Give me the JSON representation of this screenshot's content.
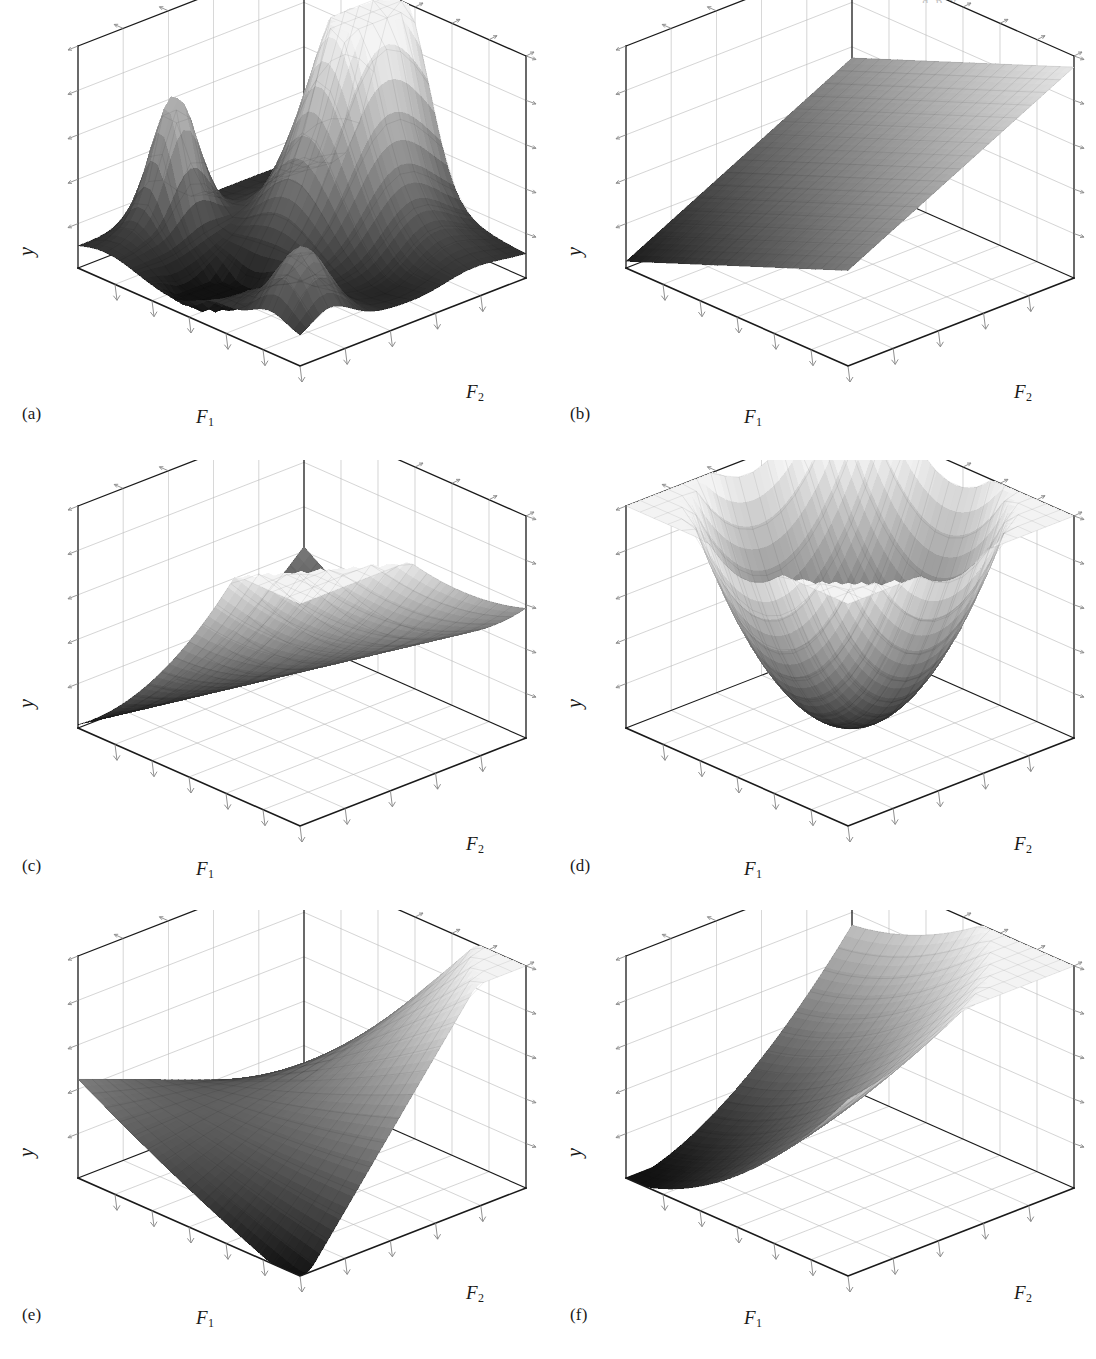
{
  "figure": {
    "page_header_fragment": "g p y",
    "layout": {
      "columns": 2,
      "rows": 3,
      "width": 1096,
      "height": 1359
    },
    "colors": {
      "background": "#ffffff",
      "axis_line": "#1a1a1a",
      "grid_line": "#b9b9b9",
      "tick_line": "#8a8a8a",
      "surface_light": "#f2f2f2",
      "surface_mid": "#7a7a7a",
      "surface_dark": "#0d0d0d",
      "mesh_line": "#5a5a5a"
    },
    "shared_axes": {
      "x_label": "F",
      "x_sub": "1",
      "z_label": "F",
      "z_sub": "2",
      "y_label": "y",
      "x_ticks": 6,
      "z_ticks": 5,
      "y_ticks": 5,
      "gridlines": true,
      "tick_labels_shown": false
    },
    "panels": [
      {
        "id": "a",
        "label": "(a)",
        "surface": "multimodal-peaks",
        "description": "Highly multimodal response surface with a tall central ridge, several secondary peaks and deep valleys"
      },
      {
        "id": "b",
        "label": "(b)",
        "surface": "planar",
        "description": "Flat inclined plane, first-order main-effects model rising with both factors"
      },
      {
        "id": "c",
        "label": "(c)",
        "surface": "rising-ridge",
        "description": "Parabolic valley / rising ridge, minimum along a curved trough"
      },
      {
        "id": "d",
        "label": "(d)",
        "surface": "bowl",
        "description": "Elliptic paraboloid bowl with a single interior minimum"
      },
      {
        "id": "e",
        "label": "(e)",
        "surface": "saddle",
        "description": "Saddle (hyperbolic paraboloid) twisted surface from a two-factor interaction"
      },
      {
        "id": "f",
        "label": "(f)",
        "surface": "folded-ridge",
        "description": "Folded stationary ridge rising steeply toward the far corner"
      }
    ]
  },
  "chart_data": [
    {
      "type": "surface",
      "panel": "a",
      "title": "(a)",
      "xlabel": "F1",
      "ylabel": "y",
      "zlabel": "F2",
      "function": "multimodal",
      "xlim": [
        0,
        1
      ],
      "zlim": [
        0,
        1
      ],
      "ylim": [
        0,
        1
      ],
      "grid": true,
      "x_ticks": 6,
      "z_ticks": 5,
      "y_ticks": 5,
      "peaks": [
        {
          "x": 0.42,
          "z": 0.82,
          "height": 1.0
        },
        {
          "x": 0.12,
          "z": 0.3,
          "height": 0.55
        },
        {
          "x": 0.78,
          "z": 0.18,
          "height": 0.33
        }
      ],
      "valleys": [
        {
          "x": 0.45,
          "z": 0.25,
          "depth": 0.02
        },
        {
          "x": 0.7,
          "z": 0.55,
          "depth": 0.08
        }
      ]
    },
    {
      "type": "surface",
      "panel": "b",
      "title": "(b)",
      "xlabel": "F1",
      "ylabel": "y",
      "zlabel": "F2",
      "function": "plane",
      "xlim": [
        0,
        1
      ],
      "zlim": [
        0,
        1
      ],
      "ylim": [
        0,
        1
      ],
      "grid": true,
      "x_ticks": 6,
      "z_ticks": 5,
      "y_ticks": 5,
      "corner_values": {
        "x0z0": 0.02,
        "x1z0": 0.4,
        "x0z1": 0.52,
        "x1z1": 0.9
      }
    },
    {
      "type": "surface",
      "panel": "c",
      "title": "(c)",
      "xlabel": "F1",
      "ylabel": "y",
      "zlabel": "F2",
      "function": "rising-ridge",
      "xlim": [
        0,
        1
      ],
      "zlim": [
        0,
        1
      ],
      "ylim": [
        0,
        1
      ],
      "grid": true,
      "x_ticks": 6,
      "z_ticks": 5,
      "y_ticks": 5,
      "trough_axis": "diagonal",
      "corner_values": {
        "x0z0": 0.95,
        "x1z0": 0.12,
        "x0z1": 0.4,
        "x1z1": 0.78
      }
    },
    {
      "type": "surface",
      "panel": "d",
      "title": "(d)",
      "xlabel": "F1",
      "ylabel": "y",
      "zlabel": "F2",
      "function": "bowl",
      "xlim": [
        0,
        1
      ],
      "zlim": [
        0,
        1
      ],
      "ylim": [
        0,
        1
      ],
      "grid": true,
      "x_ticks": 6,
      "z_ticks": 5,
      "y_ticks": 5,
      "minimum": {
        "x": 0.5,
        "z": 0.5,
        "value": 0.05
      },
      "corner_values": {
        "x0z0": 0.92,
        "x1z0": 0.9,
        "x0z1": 0.88,
        "x1z1": 0.95
      }
    },
    {
      "type": "surface",
      "panel": "e",
      "title": "(e)",
      "xlabel": "F1",
      "ylabel": "y",
      "zlabel": "F2",
      "function": "saddle",
      "xlim": [
        0,
        1
      ],
      "zlim": [
        0,
        1
      ],
      "ylim": [
        0,
        1
      ],
      "grid": true,
      "x_ticks": 6,
      "z_ticks": 5,
      "y_ticks": 5,
      "corner_values": {
        "x0z0": 0.45,
        "x1z0": 0.02,
        "x0z1": 0.4,
        "x1z1": 0.95
      }
    },
    {
      "type": "surface",
      "panel": "f",
      "title": "(f)",
      "xlabel": "F1",
      "ylabel": "y",
      "zlabel": "F2",
      "function": "folded-ridge",
      "xlim": [
        0,
        1
      ],
      "zlim": [
        0,
        1
      ],
      "ylim": [
        0,
        1
      ],
      "grid": true,
      "x_ticks": 6,
      "z_ticks": 5,
      "y_ticks": 5,
      "corner_values": {
        "x0z0": 0.1,
        "x1z0": 0.3,
        "x0z1": 0.32,
        "x1z1": 0.95
      }
    }
  ]
}
